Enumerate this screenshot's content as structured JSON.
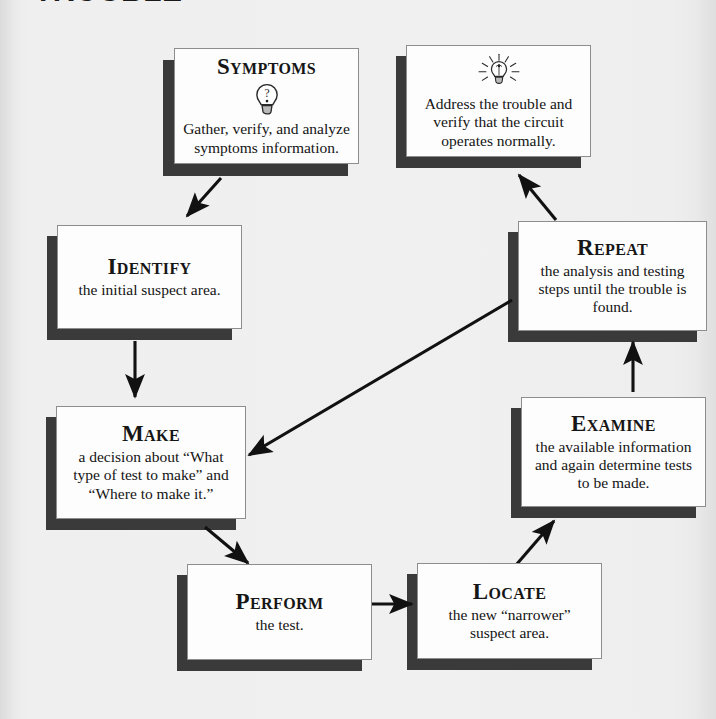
{
  "page": {
    "cut_heading": "TROUBLE",
    "background_color": "#eeeeee",
    "box_fill": "#fdfdfd",
    "box_border": "#8d8d8d",
    "shadow_color": "#3a3a3a",
    "ink_color": "#141414"
  },
  "diagram": {
    "type": "cycle-flowchart",
    "node_count": 8,
    "nodes": [
      {
        "id": "symptoms",
        "title": "Symptoms",
        "body": "Gather, verify, and analyze symptoms information.",
        "icon": "unlit-lightbulb-question-icon"
      },
      {
        "id": "address",
        "title": "",
        "body": "Address the trouble and verify that the circuit operates normally.",
        "icon": "lit-lightbulb-icon"
      },
      {
        "id": "identify",
        "title": "Identify",
        "body": "the initial suspect area.",
        "icon": ""
      },
      {
        "id": "repeat",
        "title": "Repeat",
        "body": "the analysis and testing steps until the trouble is found.",
        "icon": ""
      },
      {
        "id": "make",
        "title": "Make",
        "body": "a decision about “What type of test to make” and “Where to make it.”",
        "icon": ""
      },
      {
        "id": "examine",
        "title": "Examine",
        "body": "the available information and again determine tests to be made.",
        "icon": ""
      },
      {
        "id": "perform",
        "title": "Perform",
        "body": "the test.",
        "icon": ""
      },
      {
        "id": "locate",
        "title": "Locate",
        "body": "the new “narrower” suspect area.",
        "icon": ""
      }
    ],
    "edges": [
      {
        "from": "symptoms",
        "to": "identify",
        "style": "diagonal-down-left"
      },
      {
        "from": "identify",
        "to": "make",
        "style": "straight-down"
      },
      {
        "from": "make",
        "to": "perform",
        "style": "diagonal-down-right"
      },
      {
        "from": "perform",
        "to": "locate",
        "style": "straight-right"
      },
      {
        "from": "locate",
        "to": "examine",
        "style": "diagonal-up-right"
      },
      {
        "from": "examine",
        "to": "repeat",
        "style": "straight-up"
      },
      {
        "from": "repeat",
        "to": "address",
        "style": "diagonal-up-left"
      },
      {
        "from": "repeat",
        "to": "make",
        "style": "long-diagonal-down-left"
      }
    ]
  }
}
